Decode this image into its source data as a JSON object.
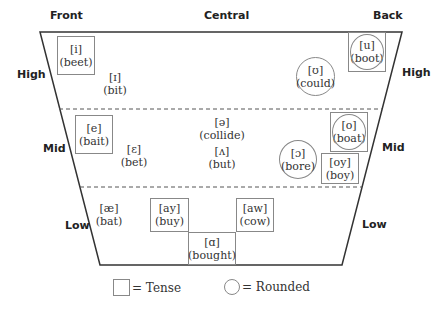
{
  "columns": {
    "front": "Front",
    "central": "Central",
    "back": "Back"
  },
  "rows_left": {
    "high": "High",
    "mid": "Mid",
    "low": "Low"
  },
  "rows_right": {
    "high": "High",
    "mid": "Mid",
    "low": "Low"
  },
  "vowels": [
    {
      "symbol": "[i]",
      "word": "(beet)",
      "tense": true,
      "rounded": false
    },
    {
      "symbol": "[ɪ]",
      "word": "(bit)",
      "tense": false,
      "rounded": false
    },
    {
      "symbol": "[ʊ]",
      "word": "(could)",
      "tense": false,
      "rounded": true
    },
    {
      "symbol": "[u]",
      "word": "(boot)",
      "tense": true,
      "rounded": true
    },
    {
      "symbol": "[e]",
      "word": "(bait)",
      "tense": true,
      "rounded": false
    },
    {
      "symbol": "[ɛ]",
      "word": "(bet)",
      "tense": false,
      "rounded": false
    },
    {
      "symbol": "[ə]",
      "word": "(collide)",
      "tense": false,
      "rounded": false
    },
    {
      "symbol": "[ʌ]",
      "word": "(but)",
      "tense": false,
      "rounded": false
    },
    {
      "symbol": "[ɔ]",
      "word": "(bore)",
      "tense": false,
      "rounded": true
    },
    {
      "symbol": "[o]",
      "word": "(boat)",
      "tense": true,
      "rounded": true
    },
    {
      "symbol": "[oy]",
      "word": "(boy)",
      "tense": true,
      "rounded": false
    },
    {
      "symbol": "[æ]",
      "word": "(bat)",
      "tense": false,
      "rounded": false
    },
    {
      "symbol": "[ay]",
      "word": "(buy)",
      "tense": true,
      "rounded": false
    },
    {
      "symbol": "[aw]",
      "word": "(cow)",
      "tense": true,
      "rounded": false
    },
    {
      "symbol": "[ɑ]",
      "word": "(bought)",
      "tense": true,
      "rounded": false
    }
  ],
  "legend": {
    "tense": "= Tense",
    "rounded": "= Rounded"
  }
}
